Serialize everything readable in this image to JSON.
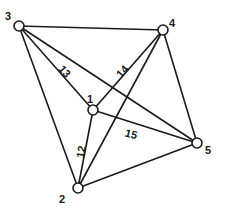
{
  "diagram": {
    "type": "complete-graph",
    "nodes": [
      {
        "id": "1",
        "label": "1",
        "x": 93,
        "y": 110,
        "label_x": 90,
        "label_y": 100
      },
      {
        "id": "2",
        "label": "2",
        "x": 78,
        "y": 188,
        "label_x": 62,
        "label_y": 200
      },
      {
        "id": "3",
        "label": "3",
        "x": 19,
        "y": 26,
        "label_x": 8,
        "label_y": 17
      },
      {
        "id": "4",
        "label": "4",
        "x": 163,
        "y": 30,
        "label_x": 172,
        "label_y": 24
      },
      {
        "id": "5",
        "label": "5",
        "x": 197,
        "y": 143,
        "label_x": 208,
        "label_y": 151
      }
    ],
    "edges": [
      {
        "from": "3",
        "to": "4",
        "label": ""
      },
      {
        "from": "3",
        "to": "1",
        "label": "13",
        "label_x": 64,
        "label_y": 72,
        "label_rot": 50
      },
      {
        "from": "3",
        "to": "5",
        "label": ""
      },
      {
        "from": "3",
        "to": "2",
        "label": ""
      },
      {
        "from": "4",
        "to": "1",
        "label": "14",
        "label_x": 123,
        "label_y": 72,
        "label_rot": -48
      },
      {
        "from": "4",
        "to": "2",
        "label": ""
      },
      {
        "from": "4",
        "to": "5",
        "label": ""
      },
      {
        "from": "1",
        "to": "2",
        "label": "12",
        "label_x": 82,
        "label_y": 152,
        "label_rot": -80
      },
      {
        "from": "1",
        "to": "5",
        "label": "15",
        "label_x": 131,
        "label_y": 135,
        "label_rot": 15
      },
      {
        "from": "2",
        "to": "5",
        "label": ""
      }
    ],
    "node_radius": 5,
    "stroke_color": "#1a1a1a",
    "background": "#ffffff"
  }
}
